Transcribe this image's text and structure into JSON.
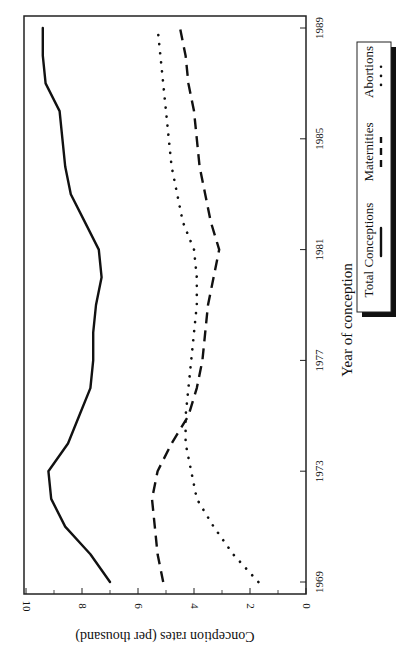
{
  "chart_data": {
    "type": "line",
    "orientation": "rotated-90-clockwise",
    "title": "",
    "xlabel": "Year of conception",
    "ylabel": "Conception rates (per thousand)",
    "x": [
      1969,
      1970,
      1971,
      1972,
      1973,
      1974,
      1975,
      1976,
      1977,
      1978,
      1979,
      1980,
      1981,
      1982,
      1983,
      1984,
      1985,
      1986,
      1987,
      1988,
      1989
    ],
    "x_ticks": [
      1969,
      1973,
      1977,
      1981,
      1985,
      1989
    ],
    "y_ticks": [
      0,
      2,
      4,
      6,
      8,
      10
    ],
    "ylim": [
      0,
      10
    ],
    "xlim": [
      1969,
      1989
    ],
    "grid": false,
    "legend_position": "right (below plot in rotated view)",
    "series": [
      {
        "name": "Total Conceptions",
        "style": "solid",
        "values": [
          7.0,
          7.7,
          8.6,
          9.1,
          9.2,
          8.5,
          8.1,
          7.7,
          7.6,
          7.6,
          7.5,
          7.3,
          7.4,
          7.9,
          8.4,
          8.6,
          8.7,
          8.8,
          9.3,
          9.4,
          9.4
        ]
      },
      {
        "name": "Maternities",
        "style": "dashed",
        "values": [
          5.1,
          5.3,
          5.4,
          5.5,
          5.3,
          4.8,
          4.2,
          3.9,
          3.7,
          3.6,
          3.5,
          3.3,
          3.1,
          3.4,
          3.6,
          3.8,
          3.9,
          4.0,
          4.2,
          4.3,
          4.5
        ]
      },
      {
        "name": "Abortions",
        "style": "dotted",
        "values": [
          1.7,
          2.6,
          3.3,
          3.9,
          4.1,
          4.3,
          4.3,
          4.2,
          4.1,
          4.0,
          3.9,
          3.9,
          4.0,
          4.4,
          4.6,
          4.8,
          4.9,
          5.0,
          5.1,
          5.2,
          5.3
        ]
      }
    ]
  },
  "labels": {
    "xlabel": "Year of conception",
    "ylabel": "Conception rates (per thousand)",
    "legend": [
      "Total Conceptions",
      "Maternities",
      "Abortions"
    ]
  },
  "colors": {
    "line": "#111111",
    "axis": "#222222",
    "background": "#ffffff"
  }
}
